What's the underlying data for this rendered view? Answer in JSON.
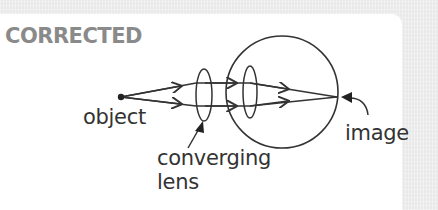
{
  "diagram": {
    "title": "CORRECTED",
    "labels": {
      "object": "object",
      "converging": "converging",
      "lens": "lens",
      "image": "image"
    },
    "colors": {
      "title": "#8a8a8a",
      "ink": "#333333",
      "panel": "#ffffff",
      "background": "#e9e9e9"
    },
    "elements": [
      {
        "id": "object-point",
        "type": "point",
        "label": "object"
      },
      {
        "id": "converging-lens",
        "type": "lens",
        "label": "converging lens"
      },
      {
        "id": "eye",
        "type": "circle",
        "label": "eye"
      },
      {
        "id": "eye-lens",
        "type": "lens",
        "label": "eye lens"
      },
      {
        "id": "image-point",
        "type": "point",
        "label": "image"
      }
    ],
    "rays": [
      {
        "from": "object-point",
        "via": [
          "converging-lens",
          "eye-lens"
        ],
        "to": "image-point",
        "position": "upper"
      },
      {
        "from": "object-point",
        "via": [
          "converging-lens",
          "eye-lens"
        ],
        "to": "image-point",
        "position": "lower"
      }
    ]
  }
}
